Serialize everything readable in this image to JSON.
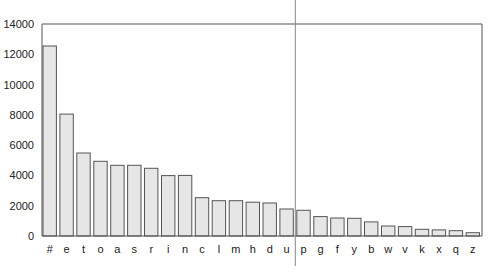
{
  "chart_data": {
    "type": "bar",
    "title": "",
    "xlabel": "",
    "ylabel": "",
    "ylim": [
      0,
      14000
    ],
    "yticks": [
      0,
      2000,
      4000,
      6000,
      8000,
      10000,
      12000,
      14000
    ],
    "grid": false,
    "legend": null,
    "categories": [
      "#",
      "e",
      "t",
      "o",
      "a",
      "s",
      "r",
      "i",
      "n",
      "c",
      "l",
      "m",
      "h",
      "d",
      "u",
      "p",
      "g",
      "f",
      "y",
      "b",
      "w",
      "v",
      "k",
      "x",
      "q",
      "z"
    ],
    "values": [
      12550,
      8050,
      5480,
      4930,
      4670,
      4670,
      4470,
      3990,
      4000,
      2530,
      2330,
      2330,
      2230,
      2180,
      1780,
      1700,
      1280,
      1190,
      1170,
      930,
      660,
      620,
      440,
      400,
      350,
      220
    ],
    "annotations": [
      {
        "type": "vertical-line",
        "between": [
          "u",
          "p"
        ]
      }
    ]
  },
  "colors": {
    "bar_fill": "#e6e6e6",
    "bar_stroke": "#555555",
    "axis": "#555555",
    "divider": "#888888"
  }
}
